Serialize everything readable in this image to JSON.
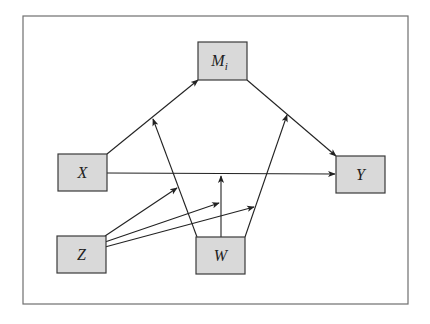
{
  "diagram": {
    "type": "path-model",
    "frame": {
      "x": 23,
      "y": 16,
      "width": 385,
      "height": 288
    },
    "colors": {
      "box_fill": "#d9d9d9",
      "box_stroke": "#3a3a3a",
      "edge": "#222222",
      "frame": "#6f6f6f"
    },
    "nodes": [
      {
        "id": "M",
        "label": "M",
        "subscript": "i",
        "x": 198,
        "y": 42,
        "w": 49,
        "h": 38
      },
      {
        "id": "X",
        "label": "X",
        "subscript": "",
        "x": 58,
        "y": 154,
        "w": 49,
        "h": 37
      },
      {
        "id": "Y",
        "label": "Y",
        "subscript": "",
        "x": 336,
        "y": 156,
        "w": 49,
        "h": 37
      },
      {
        "id": "Z",
        "label": "Z",
        "subscript": "",
        "x": 57,
        "y": 236,
        "w": 49,
        "h": 37
      },
      {
        "id": "W",
        "label": "W",
        "subscript": "",
        "x": 196,
        "y": 237,
        "w": 49,
        "h": 37
      }
    ],
    "edges": [
      {
        "id": "x-to-m",
        "from": "X",
        "to": "M",
        "x1": 107,
        "y1": 154,
        "x2": 198,
        "y2": 80
      },
      {
        "id": "m-to-y",
        "from": "M",
        "to": "Y",
        "x1": 247,
        "y1": 80,
        "x2": 336,
        "y2": 156
      },
      {
        "id": "x-to-y",
        "from": "X",
        "to": "Y",
        "x1": 107,
        "y1": 173,
        "x2": 335,
        "y2": 174
      },
      {
        "id": "w-mod-xm",
        "from": "W",
        "to": "edge:x-to-m",
        "x1": 197,
        "y1": 237,
        "x2": 153,
        "y2": 119
      },
      {
        "id": "w-mod-xy",
        "from": "W",
        "to": "edge:x-to-y",
        "x1": 221,
        "y1": 237,
        "x2": 221,
        "y2": 176
      },
      {
        "id": "w-mod-my",
        "from": "W",
        "to": "edge:m-to-y",
        "x1": 245,
        "y1": 237,
        "x2": 287,
        "y2": 115
      },
      {
        "id": "z-mod-wxm",
        "from": "Z",
        "to": "edge:w-mod-xm",
        "x1": 105,
        "y1": 236,
        "x2": 177,
        "y2": 188
      },
      {
        "id": "z-mod-wxy",
        "from": "Z",
        "to": "edge:w-mod-xy",
        "x1": 105,
        "y1": 242,
        "x2": 219,
        "y2": 203
      },
      {
        "id": "z-mod-wmy",
        "from": "Z",
        "to": "edge:w-mod-my",
        "x1": 105,
        "y1": 247,
        "x2": 254,
        "y2": 207
      }
    ]
  }
}
